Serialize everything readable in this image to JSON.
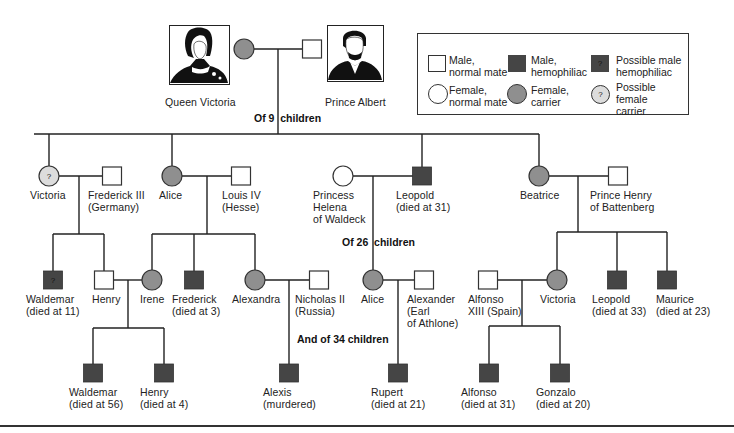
{
  "colors": {
    "line": "#222222",
    "carrier_fill": "#8f8f8f",
    "hemophiliac_fill": "#454545",
    "possible_carrier_fill": "#dcdcdc",
    "normal_fill": "#ffffff"
  },
  "portraits": {
    "queen_victoria": {
      "label": "Queen Victoria"
    },
    "prince_albert": {
      "label": "Prince Albert"
    }
  },
  "notes": {
    "gen1_children": "Of 9  children",
    "gen2_children": "Of 26  children",
    "gen3_children": "And of 34 children"
  },
  "legend": {
    "items": [
      {
        "symbol": "male-normal",
        "label": "Male,\nnormal mate"
      },
      {
        "symbol": "male-hemophiliac",
        "label": "Male,\nhemophiliac"
      },
      {
        "symbol": "possible-male-hemophiliac",
        "label": "Possible male\nhemophiliac",
        "mark": "?"
      },
      {
        "symbol": "female-normal",
        "label": "Female,\nnormal mate"
      },
      {
        "symbol": "female-carrier",
        "label": "Female,\ncarrier"
      },
      {
        "symbol": "possible-female-carrier",
        "label": "Possible\nfemale\ncarrier",
        "mark": "?"
      }
    ]
  },
  "people": [
    {
      "id": "queen_victoria",
      "shape": "circle",
      "status": "carrier",
      "x": 244,
      "y": 49
    },
    {
      "id": "prince_albert",
      "shape": "square",
      "status": "normal",
      "x": 312,
      "y": 49
    },
    {
      "id": "victoria",
      "shape": "circle",
      "status": "possible-carrier",
      "mark": "?",
      "x": 49,
      "y": 176,
      "label": "Victoria",
      "lx": 30,
      "ly": 189
    },
    {
      "id": "frederick_iii",
      "shape": "square",
      "status": "normal",
      "x": 112,
      "y": 176,
      "label": "Frederick III\n(Germany)",
      "lx": 88,
      "ly": 189
    },
    {
      "id": "alice",
      "shape": "circle",
      "status": "carrier",
      "x": 172,
      "y": 176,
      "label": "Alice",
      "lx": 159,
      "ly": 189
    },
    {
      "id": "louis_iv",
      "shape": "square",
      "status": "normal",
      "x": 241,
      "y": 176,
      "label": "Louis IV\n(Hesse)",
      "lx": 222,
      "ly": 189
    },
    {
      "id": "princess_helena",
      "shape": "circle",
      "status": "normal",
      "x": 343,
      "y": 176,
      "label": "Princess\nHelena\nof Waldeck",
      "lx": 313,
      "ly": 189
    },
    {
      "id": "leopold_31",
      "shape": "square",
      "status": "hemophiliac",
      "x": 422,
      "y": 176,
      "label": "Leopold\n(died at 31)",
      "lx": 396,
      "ly": 189
    },
    {
      "id": "beatrice",
      "shape": "circle",
      "status": "carrier",
      "x": 539,
      "y": 176,
      "label": "Beatrice",
      "lx": 520,
      "ly": 189
    },
    {
      "id": "prince_henry",
      "shape": "square",
      "status": "normal",
      "x": 618,
      "y": 176,
      "label": "Prince Henry\nof Battenberg",
      "lx": 590,
      "ly": 189
    },
    {
      "id": "waldemar_11",
      "shape": "square",
      "status": "possible-hemophiliac",
      "mark": "?",
      "x": 53,
      "y": 280,
      "label": "Waldemar\n(died at 11)",
      "lx": 26,
      "ly": 293
    },
    {
      "id": "henry",
      "shape": "square",
      "status": "normal",
      "x": 104,
      "y": 280,
      "label": "Henry",
      "lx": 92,
      "ly": 293
    },
    {
      "id": "irene",
      "shape": "circle",
      "status": "carrier",
      "x": 152,
      "y": 280,
      "label": "Irene",
      "lx": 140,
      "ly": 293
    },
    {
      "id": "frederick_3",
      "shape": "square",
      "status": "hemophiliac",
      "x": 194,
      "y": 280,
      "label": "Frederick\n(died at 3)",
      "lx": 172,
      "ly": 293
    },
    {
      "id": "alexandra",
      "shape": "circle",
      "status": "carrier",
      "x": 255,
      "y": 280,
      "label": "Alexandra",
      "lx": 232,
      "ly": 293
    },
    {
      "id": "nicholas_ii",
      "shape": "square",
      "status": "normal",
      "x": 319,
      "y": 280,
      "label": "Nicholas II\n(Russia)",
      "lx": 295,
      "ly": 293
    },
    {
      "id": "alice_2",
      "shape": "circle",
      "status": "carrier",
      "x": 373,
      "y": 280,
      "label": "Alice",
      "lx": 361,
      "ly": 293
    },
    {
      "id": "alexander",
      "shape": "square",
      "status": "normal",
      "x": 424,
      "y": 280,
      "label": "Alexander\n(Earl\nof Athlone)",
      "lx": 407,
      "ly": 293
    },
    {
      "id": "alfonso_xiii",
      "shape": "square",
      "status": "normal",
      "x": 488,
      "y": 280,
      "label": "Alfonso\nXIII (Spain)",
      "lx": 468,
      "ly": 293
    },
    {
      "id": "victoria_2",
      "shape": "circle",
      "status": "carrier",
      "x": 557,
      "y": 280,
      "label": "Victoria",
      "lx": 540,
      "ly": 293
    },
    {
      "id": "leopold_33",
      "shape": "square",
      "status": "hemophiliac",
      "x": 617,
      "y": 280,
      "label": "Leopold\n(died at 33)",
      "lx": 592,
      "ly": 293
    },
    {
      "id": "maurice",
      "shape": "square",
      "status": "hemophiliac",
      "x": 667,
      "y": 280,
      "label": "Maurice\n(died at 23)",
      "lx": 656,
      "ly": 293
    },
    {
      "id": "waldemar_56",
      "shape": "square",
      "status": "hemophiliac",
      "x": 93,
      "y": 373,
      "label": "Waldemar\n(died at 56)",
      "lx": 69,
      "ly": 386
    },
    {
      "id": "henry_4",
      "shape": "square",
      "status": "hemophiliac",
      "x": 164,
      "y": 373,
      "label": "Henry\n(died at 4)",
      "lx": 140,
      "ly": 386
    },
    {
      "id": "alexis",
      "shape": "square",
      "status": "hemophiliac",
      "x": 289,
      "y": 373,
      "label": "Alexis\n(murdered)",
      "lx": 263,
      "ly": 386
    },
    {
      "id": "rupert",
      "shape": "square",
      "status": "hemophiliac",
      "x": 398,
      "y": 373,
      "label": "Rupert\n(died at 21)",
      "lx": 371,
      "ly": 386
    },
    {
      "id": "alfonso_31",
      "shape": "square",
      "status": "hemophiliac",
      "x": 489,
      "y": 373,
      "label": "Alfonso\n(died at 31)",
      "lx": 461,
      "ly": 386
    },
    {
      "id": "gonzalo",
      "shape": "square",
      "status": "hemophiliac",
      "x": 560,
      "y": 373,
      "label": "Gonzalo\n(died at 20)",
      "lx": 536,
      "ly": 386
    }
  ],
  "lines": [
    [
      254,
      49,
      303,
      49
    ],
    [
      278,
      49,
      278,
      134
    ],
    [
      34,
      134,
      539,
      134
    ],
    [
      49,
      134,
      49,
      166
    ],
    [
      172,
      134,
      172,
      166
    ],
    [
      422,
      134,
      422,
      167
    ],
    [
      539,
      134,
      539,
      166
    ],
    [
      59,
      176,
      103,
      176
    ],
    [
      79,
      176,
      79,
      234
    ],
    [
      53,
      234,
      104,
      234
    ],
    [
      53,
      234,
      53,
      271
    ],
    [
      104,
      234,
      104,
      271
    ],
    [
      182,
      176,
      232,
      176
    ],
    [
      207,
      176,
      207,
      234
    ],
    [
      152,
      234,
      255,
      234
    ],
    [
      152,
      234,
      152,
      270
    ],
    [
      194,
      234,
      194,
      271
    ],
    [
      255,
      234,
      255,
      270
    ],
    [
      353,
      176,
      413,
      176
    ],
    [
      373,
      176,
      373,
      270
    ],
    [
      549,
      176,
      609,
      176
    ],
    [
      578,
      176,
      578,
      232
    ],
    [
      557,
      232,
      667,
      232
    ],
    [
      557,
      232,
      557,
      270
    ],
    [
      617,
      232,
      617,
      271
    ],
    [
      667,
      232,
      667,
      271
    ],
    [
      113,
      280,
      142,
      280
    ],
    [
      128,
      280,
      128,
      328
    ],
    [
      93,
      328,
      164,
      328
    ],
    [
      93,
      328,
      93,
      364
    ],
    [
      164,
      328,
      164,
      364
    ],
    [
      265,
      280,
      310,
      280
    ],
    [
      289,
      280,
      289,
      364
    ],
    [
      383,
      280,
      415,
      280
    ],
    [
      398,
      280,
      398,
      364
    ],
    [
      497,
      280,
      547,
      280
    ],
    [
      522,
      280,
      522,
      326
    ],
    [
      489,
      326,
      560,
      326
    ],
    [
      489,
      326,
      489,
      364
    ],
    [
      560,
      326,
      560,
      364
    ]
  ]
}
